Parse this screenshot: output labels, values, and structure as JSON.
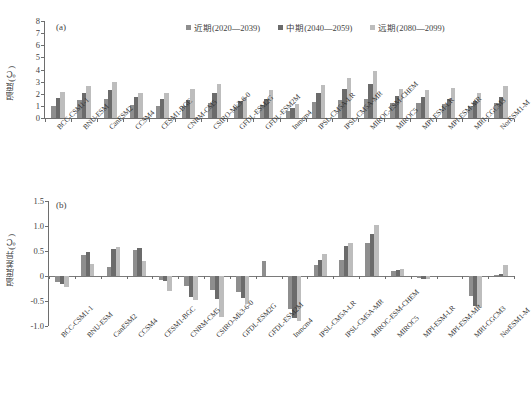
{
  "figure": {
    "top_clipped_text": "·· ···· ·· ··· ···· ·· ·· ·· ·· ··",
    "legend": [
      {
        "label": "近期(2020—2039)",
        "color": "#8e8e8e"
      },
      {
        "label": "中期(2040—2059)",
        "color": "#6b6b6b"
      },
      {
        "label": "远期(2080—2099)",
        "color": "#bdbdbd"
      }
    ],
    "categories": [
      "BCC-CSM1-1",
      "BNU-ESM",
      "CanESM2",
      "CCSM4",
      "CESM1-BGC",
      "CNRM-CM5",
      "CSIRO-Mk3-6-0",
      "GFDL-ESM2G",
      "GFDL-ESM2M",
      "Inmcm4",
      "IPSL-CM5A-LR",
      "IPSL-CM5A-MR",
      "MIROC-ESM-CHEM",
      "MIROC5",
      "MPI-ESM-LR",
      "MPI-ESM-MR",
      "MRI-CGCM3",
      "NorESM1-M"
    ]
  },
  "chart_data": [
    {
      "type": "bar",
      "panel": "(a)",
      "title": "",
      "xlabel": "",
      "ylabel": "温度(℃)",
      "ylim": [
        0,
        8
      ],
      "yticks": [
        0,
        1,
        2,
        3,
        4,
        5,
        6,
        7,
        8
      ],
      "grid": false,
      "legend_position": "top-right",
      "categories": [
        "BCC-CSM1-1",
        "BNU-ESM",
        "CanESM2",
        "CCSM4",
        "CESM1-BGC",
        "CNRM-CM5",
        "CSIRO-Mk3-6-0",
        "GFDL-ESM2G",
        "GFDL-ESM2M",
        "Inmcm4",
        "IPSL-CM5A-LR",
        "IPSL-CM5A-MR",
        "MIROC-ESM-CHEM",
        "MIROC5",
        "MPI-ESM-LR",
        "MPI-ESM-MR",
        "MRI-CGCM3",
        "NorESM1-M"
      ],
      "series": [
        {
          "name": "近期(2020—2039)",
          "color": "#8e8e8e",
          "values": [
            1.0,
            1.5,
            1.6,
            1.1,
            1.0,
            0.95,
            1.2,
            0.9,
            1.1,
            0.55,
            1.35,
            1.5,
            1.6,
            1.25,
            1.2,
            1.15,
            1.0,
            1.25
          ]
        },
        {
          "name": "中期(2040—2059)",
          "color": "#6b6b6b",
          "values": [
            1.65,
            2.05,
            2.35,
            1.7,
            1.6,
            1.5,
            2.1,
            1.4,
            1.6,
            0.8,
            2.1,
            2.4,
            2.8,
            1.85,
            1.75,
            1.6,
            1.4,
            1.75
          ]
        },
        {
          "name": "远期(2080—2099)",
          "color": "#bdbdbd",
          "values": [
            2.15,
            2.65,
            3.0,
            2.1,
            2.1,
            2.4,
            2.8,
            1.7,
            2.3,
            1.15,
            2.7,
            3.3,
            3.85,
            2.4,
            2.35,
            2.5,
            2.1,
            2.6
          ]
        }
      ]
    },
    {
      "type": "bar",
      "panel": "(b)",
      "title": "",
      "xlabel": "",
      "ylabel": "温度差异(℃)",
      "ylim": [
        -1.0,
        1.5
      ],
      "yticks": [
        -1.0,
        -0.5,
        0,
        0.5,
        1.0,
        1.5
      ],
      "grid": false,
      "legend_position": "none",
      "categories": [
        "BCC-CSM1-1",
        "BNU-ESM",
        "CanESM2",
        "CCSM4",
        "CESM1-BGC",
        "CNRM-CM5",
        "CSIRO-Mk3-6-0",
        "GFDL-ESM2G",
        "GFDL-ESM2M",
        "Inmcm4",
        "IPSL-CM5A-LR",
        "IPSL-CM5A-MR",
        "MIROC-ESM-CHEM",
        "MIROC5",
        "MPI-ESM-LR",
        "MPI-ESM-MR",
        "MRI-CGCM3",
        "NorESM1-M"
      ],
      "series": [
        {
          "name": "近期(2020—2039)",
          "color": "#8e8e8e",
          "values": [
            -0.12,
            0.42,
            0.18,
            0.52,
            -0.07,
            -0.2,
            -0.28,
            -0.32,
            0.3,
            -0.66,
            0.23,
            0.32,
            0.66,
            0.1,
            -0.04,
            0.0,
            -0.4,
            0.02
          ]
        },
        {
          "name": "中期(2040—2059)",
          "color": "#6b6b6b",
          "values": [
            -0.15,
            0.48,
            0.55,
            0.56,
            -0.1,
            -0.42,
            -0.46,
            -0.44,
            0.0,
            -0.83,
            0.32,
            0.6,
            0.84,
            0.12,
            -0.05,
            0.0,
            -0.6,
            0.05
          ]
        },
        {
          "name": "远期(2080—2099)",
          "color": "#bdbdbd",
          "values": [
            -0.22,
            0.24,
            0.58,
            0.3,
            -0.3,
            -0.48,
            -0.82,
            -0.55,
            0.0,
            -0.9,
            0.44,
            0.66,
            1.02,
            0.15,
            -0.06,
            0.0,
            -0.62,
            0.22
          ]
        }
      ]
    }
  ]
}
